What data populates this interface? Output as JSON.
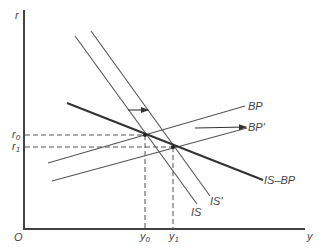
{
  "diagram": {
    "axes": {
      "y_label": "r",
      "x_label": "y",
      "origin_label": "O"
    },
    "levels": {
      "r0": {
        "label": "r",
        "sub": "0"
      },
      "r1": {
        "label": "r",
        "sub": "1"
      },
      "y0": {
        "label": "y",
        "sub": "0"
      },
      "y1": {
        "label": "y",
        "sub": "1"
      }
    },
    "curves": {
      "IS": "IS",
      "IS_prime": "IS'",
      "BP": "BP",
      "BP_prime": "BP'",
      "IS_BP": "IS–BP"
    },
    "colors": {
      "line": "#555555",
      "thick_line": "#333333",
      "text": "#444444"
    }
  }
}
